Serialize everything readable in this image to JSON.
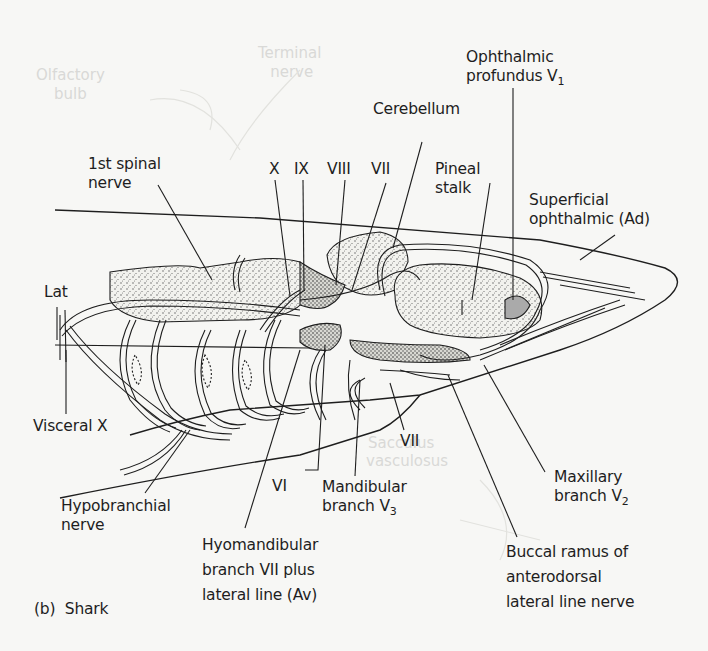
{
  "figure": {
    "panel_label": "(b)",
    "panel_title": "Shark",
    "background": "#f7f7f5",
    "ink_color": "#1e1e1e",
    "stipple_color": "#555555"
  },
  "labels": {
    "ophthalmic_profundus": {
      "line1": "Ophthalmic",
      "line2_text": "profundus V",
      "line2_sub": "1"
    },
    "cerebellum": "Cerebellum",
    "first_spinal_nerve": {
      "line1": "1st spinal",
      "line2": "nerve"
    },
    "cn_x": "X",
    "cn_ix": "IX",
    "cn_viii": "VIII",
    "cn_vii_top": "VII",
    "pineal_stalk": {
      "line1": "Pineal",
      "line2": "stalk"
    },
    "superficial_ophthalmic": {
      "line1": "Superficial",
      "line2": "ophthalmic (Ad)"
    },
    "lat": "Lat",
    "visceral_x": "Visceral X",
    "vii_lower": "VII",
    "vi": "VI",
    "mandibular_branch": {
      "line1": "Mandibular",
      "line2_text": "branch V",
      "line2_sub": "3"
    },
    "maxillary_branch": {
      "line1": "Maxillary",
      "line2_text": "branch V",
      "line2_sub": "2"
    },
    "hypobranchial_nerve": {
      "line1": "Hypobranchial",
      "line2": "nerve"
    },
    "hyomandibular_branch": {
      "line1": "Hyomandibular",
      "line2": "branch VII plus",
      "line3": "lateral line (Av)"
    },
    "buccal_ramus": {
      "line1": "Buccal ramus of",
      "line2": "anterodorsal",
      "line3": "lateral line nerve"
    }
  },
  "ghost_text": {
    "terminal_nerve": {
      "line1": "Terminal",
      "line2": "nerve"
    },
    "olfactory_bulb": {
      "line1": "Olfactory",
      "line2": "bulb"
    },
    "sacculus": "Sacculus",
    "vasculosus": "vasculosus"
  }
}
